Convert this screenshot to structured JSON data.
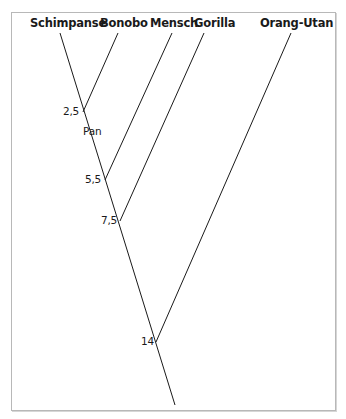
{
  "diagram": {
    "type": "phylogenetic-tree",
    "species": [
      {
        "id": "schimpanse",
        "label": "Schimpanse"
      },
      {
        "id": "bonobo",
        "label": "Bonobo"
      },
      {
        "id": "mensch",
        "label": "Mensch"
      },
      {
        "id": "gorilla",
        "label": "Gorilla"
      },
      {
        "id": "orang_utan",
        "label": "Orang-Utan"
      }
    ],
    "nodes": [
      {
        "id": "n1",
        "label": "2,5",
        "joins": [
          "schimpanse",
          "bonobo"
        ],
        "clade_label": "Pan"
      },
      {
        "id": "n2",
        "label": "5,5",
        "joins": [
          "n1",
          "mensch"
        ]
      },
      {
        "id": "n3",
        "label": "7,5",
        "joins": [
          "n2",
          "gorilla"
        ]
      },
      {
        "id": "n4",
        "label": "14",
        "joins": [
          "n3",
          "orang_utan"
        ]
      }
    ],
    "clade": {
      "label": "Pan"
    },
    "line_color": "#1a1a1a",
    "frame_color": "#b8b8b8"
  }
}
